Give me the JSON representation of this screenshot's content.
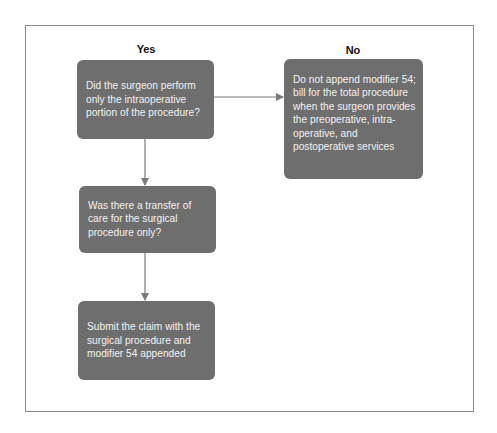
{
  "diagram": {
    "type": "flowchart",
    "column_labels": {
      "yes": "Yes",
      "no": "No"
    },
    "nodes": [
      {
        "id": "q1",
        "text": "Did the surgeon perform only the intraoperative portion of the procedure?"
      },
      {
        "id": "no_result",
        "text": "Do not append modifier 54; bill for the total procedure when the surgeon provides the preoperative, intra-operative, and postoperative services"
      },
      {
        "id": "q2",
        "text": "Was there a transfer of care for the surgical procedure only?"
      },
      {
        "id": "yes_result",
        "text": "Submit the claim with the surgical procedure and modifier 54 appended"
      }
    ],
    "edges": [
      {
        "from": "q1",
        "to": "no_result",
        "branch": "No"
      },
      {
        "from": "q1",
        "to": "q2",
        "branch": "Yes"
      },
      {
        "from": "q2",
        "to": "yes_result",
        "branch": "Yes"
      }
    ],
    "colors": {
      "box_fill": "#6e6e6e",
      "box_text": "#f2f2f2",
      "connector": "#7a7a7a",
      "frame_border": "#8a8a8a",
      "label_text": "#111111"
    }
  }
}
